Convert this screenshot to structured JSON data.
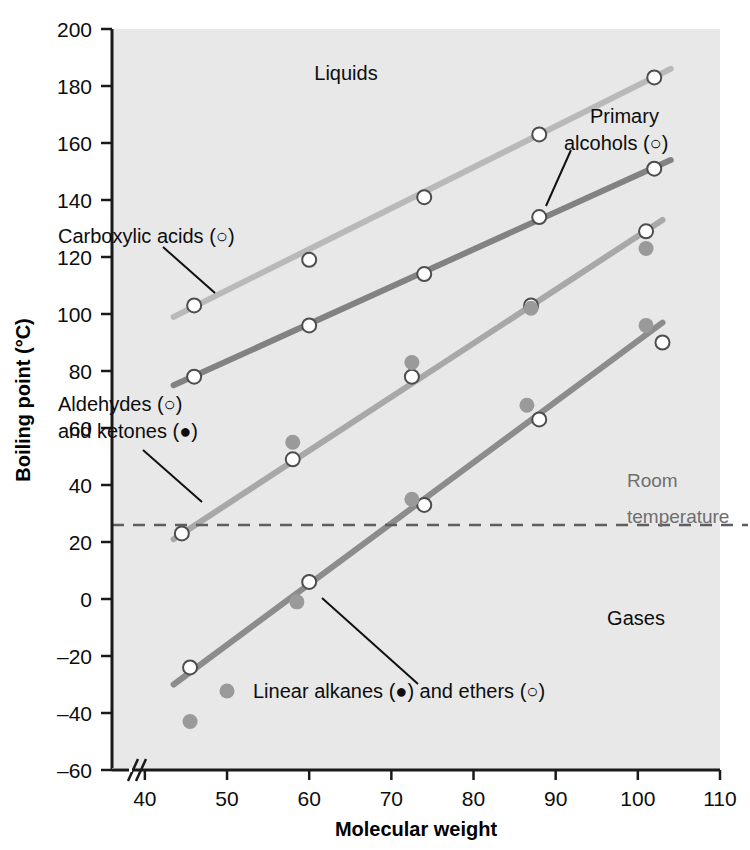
{
  "chart_data": {
    "type": "scatter",
    "title": "",
    "xlabel": "Molecular weight",
    "ylabel": "Boiling point (°C)",
    "xlim": [
      36,
      110
    ],
    "ylim": [
      -60,
      200
    ],
    "x_ticks": [
      40,
      50,
      60,
      70,
      80,
      90,
      100,
      110
    ],
    "y_ticks": [
      -60,
      -40,
      -20,
      0,
      20,
      40,
      60,
      80,
      100,
      120,
      140,
      160,
      180,
      200
    ],
    "grid": false,
    "axis_break_x": true,
    "legend_position": "inline-annotations",
    "series": [
      {
        "name": "Carboxylic acids",
        "marker": "open-circle",
        "color": "#b9b9b9",
        "points": [
          {
            "x": 46,
            "y": 103
          },
          {
            "x": 60,
            "y": 119
          },
          {
            "x": 74,
            "y": 141
          },
          {
            "x": 88,
            "y": 163
          },
          {
            "x": 102,
            "y": 183
          }
        ],
        "fit_line": {
          "x1": 43.5,
          "y1": 99,
          "x2": 104,
          "y2": 186
        }
      },
      {
        "name": "Primary alcohols",
        "marker": "open-circle",
        "color": "#828282",
        "points": [
          {
            "x": 46,
            "y": 78
          },
          {
            "x": 60,
            "y": 96
          },
          {
            "x": 74,
            "y": 114
          },
          {
            "x": 88,
            "y": 134
          },
          {
            "x": 102,
            "y": 151
          }
        ],
        "fit_line": {
          "x1": 43.5,
          "y1": 75,
          "x2": 104,
          "y2": 154
        }
      },
      {
        "name": "Aldehydes",
        "marker": "open-circle",
        "color": "#a8a8a8",
        "points": [
          {
            "x": 44.5,
            "y": 23
          },
          {
            "x": 58,
            "y": 49
          },
          {
            "x": 72.5,
            "y": 78
          },
          {
            "x": 87,
            "y": 103
          },
          {
            "x": 101,
            "y": 129
          }
        ],
        "fit_line": {
          "x1": 43.5,
          "y1": 21,
          "x2": 103,
          "y2": 133
        }
      },
      {
        "name": "Ketones",
        "marker": "filled-circle",
        "color": "#9a9a9a",
        "points": [
          {
            "x": 58,
            "y": 55
          },
          {
            "x": 72.5,
            "y": 83
          },
          {
            "x": 87,
            "y": 102
          },
          {
            "x": 101,
            "y": 123
          }
        ]
      },
      {
        "name": "Ethers",
        "marker": "open-circle",
        "color": "#8c8c8c",
        "points": [
          {
            "x": 45.5,
            "y": -24
          },
          {
            "x": 60,
            "y": 6
          },
          {
            "x": 74,
            "y": 33
          },
          {
            "x": 88,
            "y": 63
          },
          {
            "x": 103,
            "y": 90
          }
        ],
        "fit_line": {
          "x1": 43.5,
          "y1": -30,
          "x2": 103,
          "y2": 97
        }
      },
      {
        "name": "Linear alkanes",
        "marker": "filled-circle",
        "color": "#9a9a9a",
        "points": [
          {
            "x": 45.5,
            "y": -43
          },
          {
            "x": 58.5,
            "y": -1
          },
          {
            "x": 72.5,
            "y": 35
          },
          {
            "x": 86.5,
            "y": 68
          },
          {
            "x": 101,
            "y": 96
          }
        ]
      }
    ],
    "reference_lines": [
      {
        "name": "Room temperature",
        "axis": "y",
        "value": 26,
        "style": "dashed",
        "color": "#5e5e5e"
      }
    ],
    "annotations": [
      {
        "id": "liquids",
        "text": "Liquids",
        "x": 63,
        "y": 178
      },
      {
        "id": "gases",
        "text": "Gases",
        "x": 95,
        "y": -25
      },
      {
        "id": "carboxylic-acids",
        "text": "Carboxylic acids (○)",
        "x": 48,
        "y": 136
      },
      {
        "id": "primary-alcohols-line1",
        "text": "Primary",
        "x": 92,
        "y": 164
      },
      {
        "id": "primary-alcohols-line2",
        "text": "alcohols (○)",
        "x": 92,
        "y": 155
      },
      {
        "id": "aldehydes",
        "text": "Aldehydes (○)",
        "x": 46,
        "y": 69
      },
      {
        "id": "ketones",
        "text": "and ketones (●)",
        "x": 46,
        "y": 60
      },
      {
        "id": "linear-alkanes-ethers",
        "text": "Linear alkanes (●) and ethers (○)",
        "x": 62,
        "y": -42
      },
      {
        "id": "room-temperature-line1",
        "text": "Room",
        "x": 97,
        "y": 34
      },
      {
        "id": "room-temperature-line2",
        "text": "temperature",
        "x": 97,
        "y": 16
      }
    ],
    "labels": {
      "liquids": "Liquids",
      "gases": "Gases",
      "carboxylic_acids": "Carboxylic acids (○)",
      "primary_alcohols_1": "Primary",
      "primary_alcohols_2": "alcohols (○)",
      "aldehydes": "Aldehydes (○)",
      "ketones": "and ketones (●)",
      "alkanes_ethers": "Linear alkanes (●) and ethers (○)",
      "room_temp_1": "Room",
      "room_temp_2": "temperature"
    },
    "tick_text": {
      "x": [
        "40",
        "50",
        "60",
        "70",
        "80",
        "90",
        "100",
        "110"
      ],
      "y": [
        "200",
        "180",
        "160",
        "140",
        "120",
        "100",
        "80",
        "60",
        "40",
        "20",
        "0",
        "–20",
        "–40",
        "–60"
      ]
    },
    "colors": {
      "plot_background": "#e8e8e8",
      "page_background": "#ffffff",
      "axis": "#1a1a1a",
      "marker_stroke": "#4d4d4d",
      "marker_fill": "#ffffff"
    }
  }
}
